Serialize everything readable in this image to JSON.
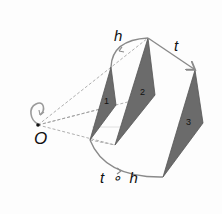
{
  "diagram": {
    "type": "geometric-transformation",
    "labels": {
      "homothety": "h",
      "translation": "t",
      "center": "O",
      "composition": "t ∘ h"
    },
    "shapes": [
      {
        "id": "1",
        "label": "1",
        "points": [
          [
            111,
            67
          ],
          [
            116,
            105
          ],
          [
            90,
            140
          ]
        ]
      },
      {
        "id": "2",
        "label": "2",
        "points": [
          [
            148,
            38
          ],
          [
            155,
            95
          ],
          [
            115,
            145
          ]
        ]
      },
      {
        "id": "3",
        "label": "3",
        "points": [
          [
            195,
            70
          ],
          [
            203,
            123
          ],
          [
            163,
            177
          ]
        ]
      }
    ],
    "colors": {
      "shape_fill": "#6b6b6b",
      "shape_stroke": "#555555",
      "arrow": "#8a8a8a",
      "dashed": "#9a9a9a",
      "text": "#111111"
    }
  }
}
